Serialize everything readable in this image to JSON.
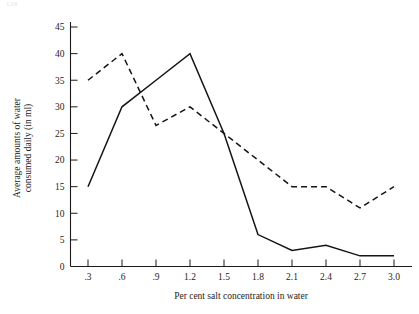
{
  "page": {
    "page_number": "126"
  },
  "chart_data": {
    "type": "line",
    "title": "",
    "xlabel": "Per cent salt concentration in water",
    "ylabel": "Average amounts of water consumed daily (in ml)",
    "x": [
      0.3,
      0.6,
      0.9,
      1.2,
      1.5,
      1.8,
      2.1,
      2.4,
      2.7,
      3.0
    ],
    "xtick_labels": [
      ".3",
      ".6",
      ".9",
      "1.2",
      "1.5",
      "1.8",
      "2.1",
      "2.4",
      "2.7",
      "3.0"
    ],
    "ytick_labels": [
      "0",
      "5",
      "10",
      "15",
      "20",
      "25",
      "30",
      "35",
      "40",
      "45"
    ],
    "ytick_values": [
      0,
      5,
      10,
      15,
      20,
      25,
      30,
      35,
      40,
      45
    ],
    "xlim": [
      0.0,
      3.15
    ],
    "ylim": [
      0,
      47
    ],
    "grid": false,
    "legend": "none",
    "series": [
      {
        "name": "solid-series",
        "style": "solid",
        "values": [
          15,
          30,
          35,
          40,
          25,
          6,
          3,
          4,
          2,
          2
        ]
      },
      {
        "name": "dashed-series",
        "style": "dashed",
        "values": [
          35,
          40,
          26.5,
          30,
          25,
          20,
          15,
          15,
          11,
          15
        ]
      }
    ]
  }
}
